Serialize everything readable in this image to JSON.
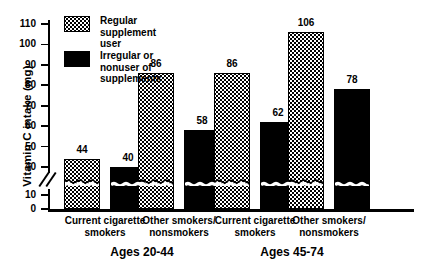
{
  "chart_data": {
    "type": "bar",
    "title": "",
    "xlabel": "",
    "ylabel": "Vitamin C intake (mg)",
    "ylim": [
      0,
      110
    ],
    "y_ticks": [
      0,
      10,
      40,
      50,
      60,
      70,
      80,
      90,
      100,
      110
    ],
    "y_axis_break": {
      "present": true,
      "from": 10,
      "to": 40,
      "style": "double-slash-on-axis-and-wavy-line-across-bars"
    },
    "grid": false,
    "legend_position": "upper-left-inside",
    "categories": [
      "Current cigarette smokers",
      "Other smokers/ nonsmokers",
      "Current cigarette smokers",
      "Other smokers/ nonsmokers"
    ],
    "groups": [
      {
        "label": "Ages 20-44",
        "categories": [
          "Current cigarette smokers",
          "Other smokers/ nonsmokers"
        ]
      },
      {
        "label": "Ages 45-74",
        "categories": [
          "Current cigarette smokers",
          "Other smokers/ nonsmokers"
        ]
      }
    ],
    "series": [
      {
        "name": "Regular supplement user",
        "pattern": "dotted",
        "values": [
          44,
          86,
          86,
          106
        ]
      },
      {
        "name": "Irregular or nonuser of supplements",
        "pattern": "solid",
        "values": [
          40,
          58,
          62,
          78
        ]
      }
    ],
    "bars": [
      {
        "group": "Ages 20-44",
        "category": "Current cigarette smokers",
        "series": "Regular supplement user",
        "value": 44,
        "label": "44",
        "pattern": "dotted"
      },
      {
        "group": "Ages 20-44",
        "category": "Current cigarette smokers",
        "series": "Irregular or nonuser of supplements",
        "value": 40,
        "label": "40",
        "pattern": "solid"
      },
      {
        "group": "Ages 20-44",
        "category": "Other smokers/ nonsmokers",
        "series": "Regular supplement user",
        "value": 86,
        "label": "86",
        "pattern": "dotted"
      },
      {
        "group": "Ages 20-44",
        "category": "Other smokers/ nonsmokers",
        "series": "Irregular or nonuser of supplements",
        "value": 58,
        "label": "58",
        "pattern": "solid"
      },
      {
        "group": "Ages 45-74",
        "category": "Current cigarette smokers",
        "series": "Regular supplement user",
        "value": 86,
        "label": "86",
        "pattern": "dotted"
      },
      {
        "group": "Ages 45-74",
        "category": "Current cigarette smokers",
        "series": "Irregular or nonuser of supplements",
        "value": 62,
        "label": "62",
        "pattern": "solid"
      },
      {
        "group": "Ages 45-74",
        "category": "Other smokers/ nonsmokers",
        "series": "Regular supplement user",
        "value": 106,
        "label": "106",
        "pattern": "dotted"
      },
      {
        "group": "Ages 45-74",
        "category": "Other smokers/ nonsmokers",
        "series": "Irregular or nonuser of supplements",
        "value": 78,
        "label": "78",
        "pattern": "solid"
      }
    ]
  },
  "axis": {
    "y_title": "Vitamin C intake (mg)",
    "tick_labels": [
      "110",
      "100",
      "90",
      "80",
      "70",
      "60",
      "50",
      "40",
      "10",
      "0"
    ]
  },
  "legend": {
    "items": [
      {
        "label": "Regular\nsupplement user",
        "pattern": "dotted"
      },
      {
        "label": "Irregular or nonuser of\nsupplements",
        "pattern": "solid"
      }
    ]
  },
  "categories_display": [
    "Current cigarette\nsmokers",
    "Other smokers/\nnonsmokers",
    "Current cigarette\nsmokers",
    "Other smokers/\nnonsmokers"
  ],
  "group_labels": [
    "Ages 20-44",
    "Ages 45-74"
  ],
  "colors": {
    "ink": "#000000",
    "background": "#ffffff"
  }
}
